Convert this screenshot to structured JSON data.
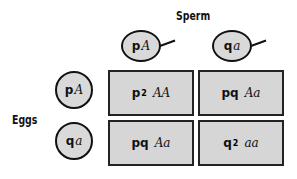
{
  "labels": {
    "sperm": "Sperm",
    "eggs": "Eggs"
  },
  "sperm": [
    {
      "freq": "p",
      "allele": "A"
    },
    {
      "freq": "q",
      "allele": "a"
    }
  ],
  "eggs": [
    {
      "freq": "p",
      "allele": "A"
    },
    {
      "freq": "q",
      "allele": "a"
    }
  ],
  "cells": [
    {
      "freq": "p",
      "exp": "2",
      "genotype": "AA"
    },
    {
      "freq": "pq",
      "exp": "",
      "genotype": "Aa"
    },
    {
      "freq": "pq",
      "exp": "",
      "genotype": "Aa"
    },
    {
      "freq": "q",
      "exp": "2",
      "genotype": "aa"
    }
  ],
  "colors": {
    "fill": "#d6d6d6",
    "stroke": "#111111"
  }
}
